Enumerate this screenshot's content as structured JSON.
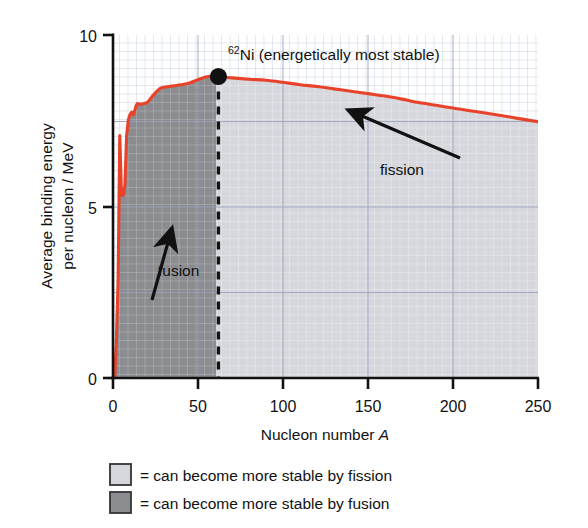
{
  "chart_data": {
    "type": "line",
    "title": "",
    "xlabel": "Nucleon number A",
    "ylabel_line1": "Average binding energy",
    "ylabel_line2": "per nucleon / MeV",
    "xlim": [
      0,
      250
    ],
    "ylim": [
      0,
      10
    ],
    "xticks": [
      0,
      50,
      100,
      150,
      200,
      250
    ],
    "yticks": [
      0,
      5,
      10
    ],
    "grid": true,
    "legend_position": "below-axes",
    "series": [
      {
        "name": "binding energy per nucleon",
        "color": "#e8422a",
        "x": [
          1,
          2,
          3,
          4,
          5,
          6,
          7,
          8,
          9,
          10,
          11,
          12,
          14,
          16,
          20,
          24,
          28,
          32,
          36,
          40,
          45,
          50,
          56,
          62,
          70,
          80,
          90,
          100,
          110,
          120,
          130,
          140,
          150,
          160,
          170,
          180,
          190,
          200,
          210,
          220,
          230,
          238,
          250
        ],
        "y": [
          0.0,
          1.11,
          2.83,
          7.07,
          5.33,
          5.33,
          5.61,
          7.06,
          7.52,
          7.68,
          7.75,
          7.68,
          7.98,
          7.98,
          8.03,
          8.26,
          8.45,
          8.49,
          8.52,
          8.55,
          8.6,
          8.7,
          8.79,
          8.79,
          8.75,
          8.71,
          8.68,
          8.62,
          8.55,
          8.5,
          8.43,
          8.36,
          8.29,
          8.22,
          8.13,
          8.03,
          7.95,
          7.87,
          7.79,
          7.72,
          7.64,
          7.57,
          7.47
        ]
      }
    ],
    "annotations": [
      {
        "name": "peak-marker",
        "label_sup": "62",
        "label_main": "Ni (energetically most stable)",
        "x": 62,
        "y": 8.79,
        "marker": "filled-circle"
      },
      {
        "name": "fusion-arrow-label",
        "label": "fusion",
        "x": 33,
        "y": 3.9
      },
      {
        "name": "fission-arrow-label",
        "label": "fission",
        "x": 145,
        "y": 6.6
      }
    ],
    "regions": [
      {
        "name": "fusion-region",
        "x_range": [
          0,
          62
        ],
        "color": "#8a8c90",
        "meaning": "can become more stable by fusion"
      },
      {
        "name": "fission-region",
        "x_range": [
          62,
          250
        ],
        "color": "#d5d7dc",
        "meaning": "can become more stable by fission"
      }
    ],
    "divider_line": {
      "name": "stability-divider",
      "x": 62,
      "style": "dashed",
      "color": "#141414"
    }
  },
  "legend": {
    "items": [
      {
        "swatch_color": "#d5d7dc",
        "text": "= can become more stable by fission"
      },
      {
        "swatch_color": "#8a8c90",
        "text": "= can become more stable by fusion"
      }
    ]
  },
  "axis": {
    "x_tick_labels": [
      "0",
      "50",
      "100",
      "150",
      "200",
      "250"
    ],
    "y_tick_labels": [
      "0",
      "5",
      "10"
    ]
  }
}
